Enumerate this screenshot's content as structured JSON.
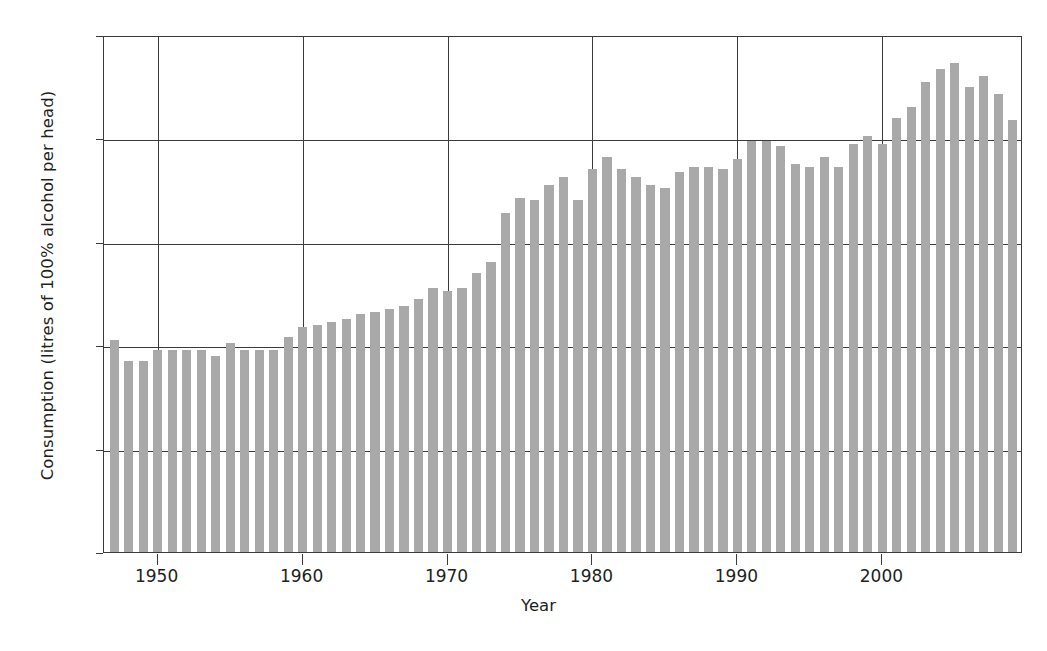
{
  "chart_data": {
    "type": "bar",
    "title": "",
    "xlabel": "Year",
    "ylabel": "Consumption (litres of 100% alcohol per head)",
    "xlim": [
      1946.3,
      2009.7
    ],
    "ylim": [
      0,
      10
    ],
    "yticks": [
      0,
      2,
      4,
      6,
      8,
      10
    ],
    "xticks": [
      1950,
      1960,
      1970,
      1980,
      1990,
      2000
    ],
    "grid": true,
    "legend": null,
    "bar_color": "#a9a9a9",
    "axis_color": "#3b3b3b",
    "series_name": "Alcohol consumption per head",
    "categories": [
      1947,
      1948,
      1949,
      1950,
      1951,
      1952,
      1953,
      1954,
      1955,
      1956,
      1957,
      1958,
      1959,
      1960,
      1961,
      1962,
      1963,
      1964,
      1965,
      1966,
      1967,
      1968,
      1969,
      1970,
      1971,
      1972,
      1973,
      1974,
      1975,
      1976,
      1977,
      1978,
      1979,
      1980,
      1981,
      1982,
      1983,
      1984,
      1985,
      1986,
      1987,
      1988,
      1989,
      1990,
      1991,
      1992,
      1993,
      1994,
      1995,
      1996,
      1997,
      1998,
      1999,
      2000,
      2001,
      2002,
      2003,
      2004,
      2005,
      2006,
      2007,
      2008,
      2009
    ],
    "values": [
      4.1,
      3.7,
      3.7,
      3.9,
      3.9,
      3.9,
      3.9,
      3.8,
      4.05,
      3.9,
      3.9,
      3.9,
      4.15,
      4.35,
      4.4,
      4.45,
      4.5,
      4.6,
      4.65,
      4.7,
      4.75,
      4.9,
      5.1,
      5.05,
      5.1,
      5.4,
      5.6,
      6.55,
      6.85,
      6.8,
      7.1,
      7.25,
      6.8,
      7.4,
      7.65,
      7.4,
      7.25,
      7.1,
      7.05,
      7.35,
      7.45,
      7.45,
      7.4,
      7.6,
      7.95,
      7.95,
      7.85,
      7.5,
      7.45,
      7.65,
      7.45,
      7.9,
      8.05,
      7.9,
      8.4,
      8.6,
      9.1,
      9.35,
      9.45,
      9.0,
      9.2,
      8.85,
      8.35
    ]
  },
  "axes": {
    "ytick_labels": [
      "10",
      "8",
      "6",
      "4",
      "2",
      "0"
    ],
    "xtick_labels": [
      "1950",
      "1960",
      "1970",
      "1980",
      "1990",
      "2000"
    ],
    "xlabel_text": "Year",
    "ylabel_text": "Consumption (litres of 100% alcohol per head)"
  }
}
